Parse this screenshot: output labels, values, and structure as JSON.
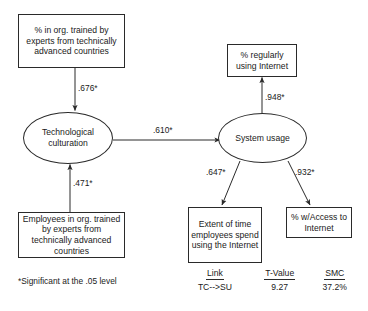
{
  "diagram": {
    "nodes": {
      "top_left_indicator": "% in org. trained by experts from technically advanced countries",
      "bottom_left_indicator": "Employees in org. trained by experts from technically advanced countries",
      "left_construct": "Technological culturation",
      "right_construct": "System usage",
      "top_right_indicator": "% regularly using Internet",
      "bottom_mid_indicator": "Extent of time employees spend using the Internet",
      "bottom_right_indicator": "% w/Access to Internet"
    },
    "edge_labels": {
      "top_left_to_construct": ".676*",
      "bottom_left_to_construct": ".471*",
      "construct_to_construct": ".610*",
      "construct_to_top_right": ".948*",
      "construct_to_bottom_mid": ".647*",
      "construct_to_bottom_right": ".932*"
    },
    "footnote": "*Significant at the .05 level",
    "stats_table": {
      "headers": [
        "Link",
        "T-Value",
        "SMC"
      ],
      "rows": [
        [
          "TC-->SU",
          "9.27",
          "37.2%"
        ]
      ]
    },
    "colors": {
      "stroke": "#2a2a2a",
      "text": "#1a1a1a",
      "background": "#ffffff"
    }
  }
}
